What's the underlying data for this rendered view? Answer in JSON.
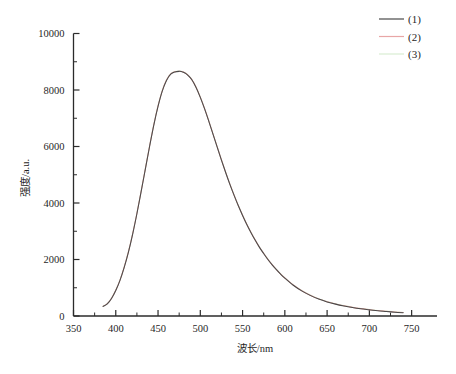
{
  "chart_data": {
    "type": "line",
    "title": "",
    "xlabel": "波长/nm",
    "ylabel": "强度/a.u.",
    "xlim": [
      350,
      750
    ],
    "ylim": [
      0,
      10000
    ],
    "xticks": [
      350,
      400,
      450,
      500,
      550,
      600,
      650,
      700,
      750
    ],
    "xtick_labels": [
      "350",
      "400",
      "450",
      "500",
      "550",
      "600",
      "650",
      "700",
      "750"
    ],
    "yticks": [
      0,
      2000,
      4000,
      6000,
      8000,
      10000
    ],
    "ytick_labels": [
      "0",
      "2000",
      "4000",
      "6000",
      "8000",
      "10000"
    ],
    "minor_ticks": true,
    "grid": false,
    "legend_position": "top-right",
    "x": [
      385,
      390,
      395,
      400,
      405,
      410,
      415,
      420,
      425,
      430,
      435,
      440,
      445,
      450,
      455,
      460,
      465,
      470,
      475,
      478,
      480,
      483,
      486,
      490,
      495,
      500,
      505,
      510,
      515,
      520,
      525,
      530,
      535,
      540,
      545,
      550,
      555,
      560,
      565,
      570,
      575,
      580,
      585,
      590,
      595,
      600,
      610,
      620,
      630,
      640,
      650,
      660,
      670,
      680,
      690,
      700,
      710,
      720,
      730,
      740
    ],
    "series": [
      {
        "name": "(1)",
        "label": "(1)",
        "color": "#4a4a4a",
        "values": [
          340,
          430,
          620,
          900,
          1260,
          1720,
          2260,
          2900,
          3620,
          4400,
          5200,
          6000,
          6760,
          7420,
          7960,
          8340,
          8560,
          8640,
          8660,
          8650,
          8630,
          8580,
          8500,
          8360,
          8090,
          7740,
          7340,
          6900,
          6440,
          5980,
          5520,
          5080,
          4660,
          4270,
          3900,
          3560,
          3240,
          2950,
          2680,
          2430,
          2210,
          2000,
          1810,
          1640,
          1480,
          1340,
          1090,
          890,
          730,
          600,
          500,
          420,
          355,
          300,
          255,
          220,
          185,
          160,
          135,
          115
        ]
      },
      {
        "name": "(2)",
        "label": "(2)",
        "color": "#e8a6a6",
        "values": [
          345,
          436,
          628,
          910,
          1272,
          1734,
          2275,
          2915,
          3636,
          4416,
          5216,
          6016,
          6775,
          7434,
          7972,
          8350,
          8568,
          8648,
          8666,
          8656,
          8636,
          8586,
          8506,
          8366,
          8096,
          7746,
          7346,
          6906,
          6446,
          5986,
          5526,
          5086,
          4666,
          4276,
          3906,
          3566,
          3246,
          2956,
          2686,
          2436,
          2216,
          2006,
          1816,
          1646,
          1486,
          1346,
          1096,
          896,
          736,
          606,
          506,
          426,
          361,
          306,
          261,
          226,
          191,
          166,
          141,
          121
        ]
      },
      {
        "name": "(3)",
        "label": "(3)",
        "color": "#d8ecd2",
        "values": [
          350,
          442,
          634,
          918,
          1280,
          1742,
          2284,
          2924,
          3646,
          4426,
          5226,
          6026,
          6786,
          7444,
          7982,
          8358,
          8574,
          8654,
          8672,
          8662,
          8642,
          8592,
          8512,
          8372,
          8102,
          7752,
          7352,
          6912,
          6452,
          5992,
          5532,
          5092,
          4672,
          4282,
          3912,
          3572,
          3252,
          2962,
          2692,
          2442,
          2222,
          2012,
          1822,
          1652,
          1492,
          1352,
          1102,
          902,
          742,
          612,
          512,
          432,
          367,
          312,
          267,
          232,
          197,
          172,
          147,
          127
        ]
      }
    ]
  },
  "legend": {
    "entries": [
      {
        "label": "(1)",
        "color": "#4a4a4a"
      },
      {
        "label": "(2)",
        "color": "#e8a6a6"
      },
      {
        "label": "(3)",
        "color": "#d8ecd2"
      }
    ]
  },
  "axes": {
    "x_title": "波长/nm",
    "y_title": "强度/a.u."
  }
}
